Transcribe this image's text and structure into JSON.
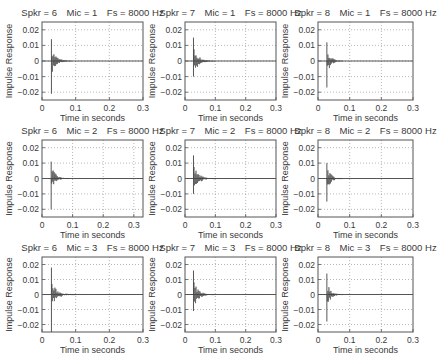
{
  "figure": {
    "rows": 3,
    "cols": 3,
    "background": "#ffffff",
    "line_color": "#444444",
    "grid_color": "#888888",
    "axis_color": "#555555"
  },
  "chart_data": [
    {
      "type": "line",
      "title": "Spkr = 6   Mic = 1   Fs = 8000 Hz",
      "xlabel": "Time in seconds",
      "ylabel": "Impulse Response",
      "xlim": [
        0,
        0.3
      ],
      "ylim": [
        -0.025,
        0.025
      ],
      "xticks": [
        "0",
        "0.1",
        "0.2",
        "0.3"
      ],
      "yticks": [
        "0.02",
        "0.01",
        "0",
        "-0.01",
        "-0.02"
      ],
      "grid": true,
      "onset": 0.028,
      "peak_pos": 0.014,
      "peak_neg": -0.021,
      "decay_end": 0.09
    },
    {
      "type": "line",
      "title": "Spkr = 7   Mic = 1   Fs = 8000 Hz",
      "xlabel": "Time in seconds",
      "ylabel": "Impulse Response",
      "xlim": [
        0,
        0.3
      ],
      "ylim": [
        -0.025,
        0.025
      ],
      "xticks": [
        "0",
        "0.1",
        "0.2",
        "0.3"
      ],
      "yticks": [
        "0.02",
        "0.01",
        "0",
        "-0.01",
        "-0.02"
      ],
      "grid": true,
      "onset": 0.028,
      "peak_pos": 0.015,
      "peak_neg": -0.01,
      "decay_end": 0.1
    },
    {
      "type": "line",
      "title": "Spkr = 8   Mic = 1   Fs = 8000 Hz",
      "xlabel": "Time in seconds",
      "ylabel": "Impulse Response",
      "xlim": [
        0,
        0.3
      ],
      "ylim": [
        -0.025,
        0.025
      ],
      "xticks": [
        "0",
        "0.1",
        "0.2",
        "0.3"
      ],
      "yticks": [
        "0.02",
        "0.01",
        "0",
        "-0.01",
        "-0.02"
      ],
      "grid": true,
      "onset": 0.028,
      "peak_pos": 0.012,
      "peak_neg": -0.017,
      "decay_end": 0.08
    },
    {
      "type": "line",
      "title": "Spkr = 6   Mic = 2   Fs = 8000 Hz",
      "xlabel": "Time in seconds",
      "ylabel": "Impulse Response",
      "xlim": [
        0,
        0.33
      ],
      "ylim": [
        -0.025,
        0.025
      ],
      "xticks": [
        "0",
        "0.1",
        "0.2",
        "0.3"
      ],
      "yticks": [
        "0.02",
        "0.01",
        "0",
        "-0.01",
        "-0.02"
      ],
      "grid": true,
      "onset": 0.03,
      "peak_pos": 0.011,
      "peak_neg": -0.02,
      "decay_end": 0.09
    },
    {
      "type": "line",
      "title": "Spkr = 7   Mic = 2   Fs = 8000 Hz",
      "xlabel": "Time in seconds",
      "ylabel": "Impulse Response",
      "xlim": [
        0,
        0.3
      ],
      "ylim": [
        -0.025,
        0.025
      ],
      "xticks": [
        "0",
        "0.1",
        "0.2",
        "0.3"
      ],
      "yticks": [
        "0.02",
        "0.01",
        "0",
        "-0.01",
        "-0.02"
      ],
      "grid": true,
      "onset": 0.028,
      "peak_pos": 0.015,
      "peak_neg": -0.01,
      "decay_end": 0.1
    },
    {
      "type": "line",
      "title": "Spkr = 8   Mic = 2   Fs = 8000 Hz",
      "xlabel": "Time in seconds",
      "ylabel": "Impulse Response",
      "xlim": [
        0,
        0.3
      ],
      "ylim": [
        -0.025,
        0.025
      ],
      "xticks": [
        "0",
        "0.1",
        "0.2",
        "0.3"
      ],
      "yticks": [
        "0.02",
        "0.01",
        "0",
        "-0.01",
        "-0.02"
      ],
      "grid": true,
      "onset": 0.028,
      "peak_pos": 0.01,
      "peak_neg": -0.015,
      "decay_end": 0.08
    },
    {
      "type": "line",
      "title": "Spkr = 6   Mic = 3   Fs = 8000 Hz",
      "xlabel": "Time in seconds",
      "ylabel": "Impulse Response",
      "xlim": [
        0,
        0.3
      ],
      "ylim": [
        -0.025,
        0.025
      ],
      "xticks": [
        "0",
        "0.1",
        "0.2",
        "0.3"
      ],
      "yticks": [
        "0.02",
        "0.01",
        "0",
        "-0.01",
        "-0.02"
      ],
      "grid": true,
      "onset": 0.028,
      "peak_pos": 0.018,
      "peak_neg": -0.025,
      "decay_end": 0.1
    },
    {
      "type": "line",
      "title": "Spkr = 7   Mic = 3   Fs = 8000 Hz",
      "xlabel": "Time in seconds",
      "ylabel": "Impulse Response",
      "xlim": [
        0,
        0.3
      ],
      "ylim": [
        -0.025,
        0.025
      ],
      "xticks": [
        "0",
        "0.1",
        "0.2",
        "0.3"
      ],
      "yticks": [
        "0.02",
        "0.01",
        "0",
        "-0.01",
        "-0.02"
      ],
      "grid": true,
      "onset": 0.028,
      "peak_pos": 0.016,
      "peak_neg": -0.011,
      "decay_end": 0.1
    },
    {
      "type": "line",
      "title": "Spkr = 8   Mic = 3   Fs = 8000 Hz",
      "xlabel": "Time in seconds",
      "ylabel": "Impulse Response",
      "xlim": [
        0,
        0.3
      ],
      "ylim": [
        -0.025,
        0.025
      ],
      "xticks": [
        "0",
        "0.1",
        "0.2",
        "0.3"
      ],
      "yticks": [
        "0.02",
        "0.01",
        "0",
        "-0.01",
        "-0.02"
      ],
      "grid": true,
      "onset": 0.028,
      "peak_pos": 0.014,
      "peak_neg": -0.018,
      "decay_end": 0.08
    }
  ]
}
